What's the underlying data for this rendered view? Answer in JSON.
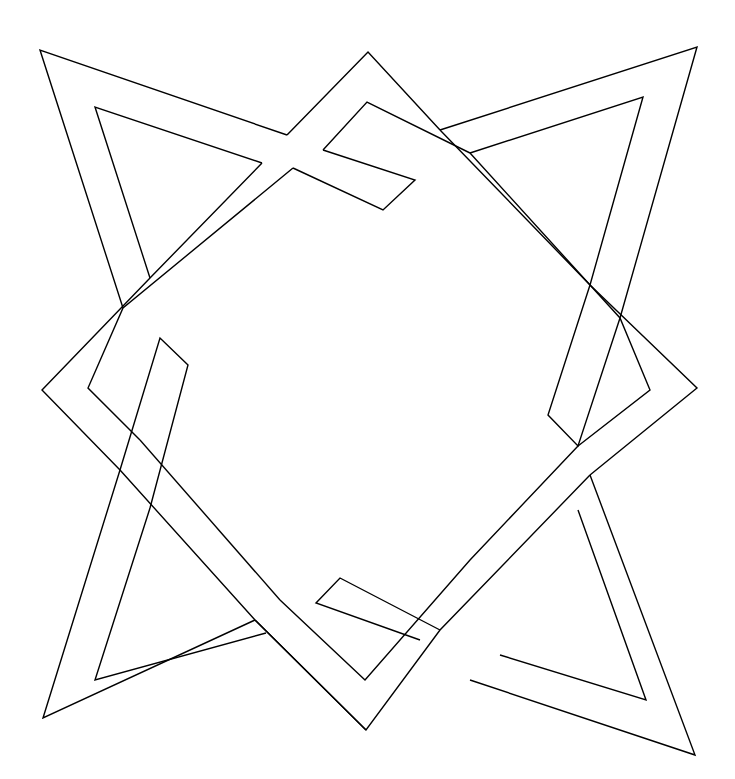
{
  "figure": {
    "stroke_color": "#000000",
    "background_color": "#ffffff",
    "stroke_width": 1.4
  }
}
